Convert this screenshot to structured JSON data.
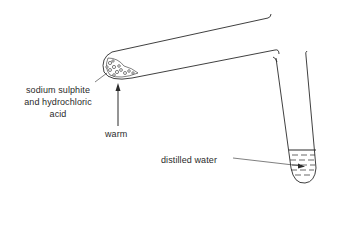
{
  "diagram": {
    "labels": {
      "reactants_line1": "sodium sulphite",
      "reactants_line2": "and hydrochloric",
      "reactants_line3": "acid",
      "heat": "warm",
      "collector": "distilled water"
    },
    "components": [
      {
        "name": "boiling-tube",
        "description": "tilted tube containing reactants"
      },
      {
        "name": "delivery-tube",
        "description": "bent glass tube leading down"
      },
      {
        "name": "collecting-test-tube",
        "description": "test tube containing distilled water"
      }
    ],
    "colors": {
      "line": "#2a2a2a",
      "background": "#ffffff"
    }
  }
}
